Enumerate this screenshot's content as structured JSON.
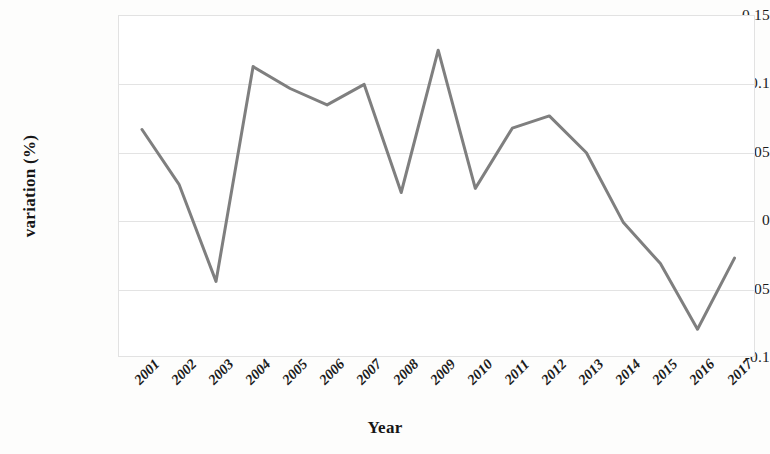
{
  "chart_data": {
    "type": "line",
    "title": "",
    "xlabel": "Year",
    "ylabel": "variation (%)",
    "categories": [
      "2001",
      "2002",
      "2003",
      "2004",
      "2005",
      "2006",
      "2007",
      "2008",
      "2009",
      "2010",
      "2011",
      "2012",
      "2013",
      "2014",
      "2015",
      "2016",
      "2017"
    ],
    "values": [
      0.067,
      0.027,
      -0.044,
      0.113,
      0.097,
      0.085,
      0.1,
      0.021,
      0.125,
      0.024,
      0.068,
      0.077,
      0.05,
      -0.001,
      -0.031,
      -0.079,
      -0.027
    ],
    "series": [
      {
        "name": "variation (%)",
        "values": [
          0.067,
          0.027,
          -0.044,
          0.113,
          0.097,
          0.085,
          0.1,
          0.021,
          0.125,
          0.024,
          0.068,
          0.077,
          0.05,
          -0.001,
          -0.031,
          -0.079,
          -0.027
        ],
        "color": "#7f7f7f"
      }
    ],
    "yticks": [
      0.15,
      0.1,
      0.05,
      0,
      -0.05,
      -0.1
    ],
    "ytick_labels": [
      "0.15",
      "0.1",
      "0.05",
      "0",
      "-0.05",
      "-0.1"
    ],
    "ylim": [
      -0.1,
      0.15
    ],
    "grid": true,
    "legend": "none",
    "line_color": "#7f7f7f",
    "line_width": 3,
    "frame_color": "#e2e2e2",
    "grid_color": "#e3e3e3",
    "background": "#ffffff"
  }
}
